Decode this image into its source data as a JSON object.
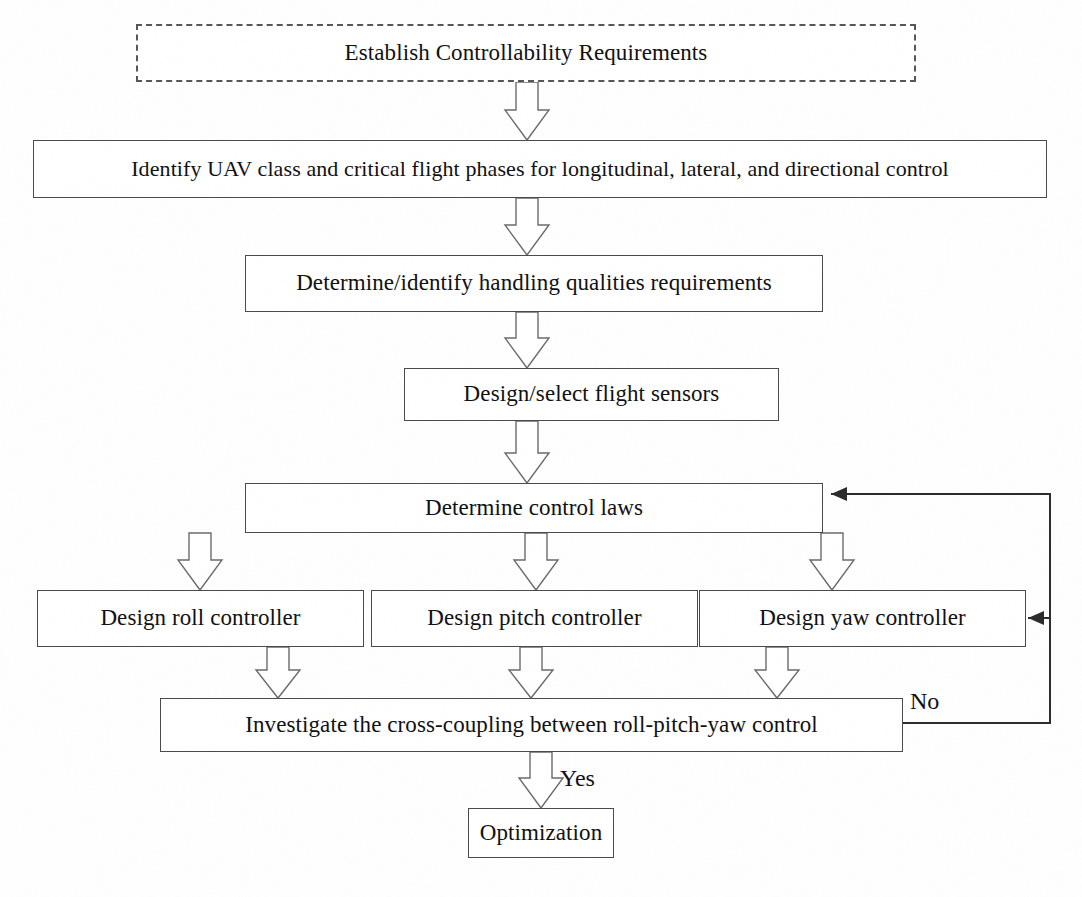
{
  "diagram": {
    "canvas": {
      "width": 1082,
      "height": 897
    },
    "colors": {
      "background": "#fefefe",
      "box_border": "#4a4a4a",
      "dashed_border": "#55555a",
      "arrow_outline": "#6b6b6b",
      "arrow_fill": "#ffffff",
      "line": "#2b2b2b",
      "text": "#101010"
    },
    "nodes": [
      {
        "id": "establish",
        "label": "Establish Controllability Requirements",
        "style": "dashed",
        "x": 136,
        "y": 24,
        "w": 780,
        "h": 58,
        "font_size": 23
      },
      {
        "id": "identify",
        "label": "Identify UAV class and critical flight phases for longitudinal, lateral, and directional control",
        "style": "solid",
        "x": 33,
        "y": 140,
        "w": 1014,
        "h": 58,
        "font_size": 22
      },
      {
        "id": "handling",
        "label": "Determine/identify handling qualities requirements",
        "style": "solid",
        "x": 245,
        "y": 255,
        "w": 578,
        "h": 57,
        "font_size": 23
      },
      {
        "id": "sensors",
        "label": "Design/select flight sensors",
        "style": "solid",
        "x": 404,
        "y": 368,
        "w": 375,
        "h": 53,
        "font_size": 23
      },
      {
        "id": "control-laws",
        "label": "Determine control laws",
        "style": "solid",
        "x": 245,
        "y": 483,
        "w": 578,
        "h": 50,
        "font_size": 23
      },
      {
        "id": "roll",
        "label": "Design roll controller",
        "style": "solid",
        "x": 37,
        "y": 590,
        "w": 327,
        "h": 57,
        "font_size": 23
      },
      {
        "id": "pitch",
        "label": "Design pitch controller",
        "style": "solid",
        "x": 371,
        "y": 590,
        "w": 327,
        "h": 57,
        "font_size": 23
      },
      {
        "id": "yaw",
        "label": "Design yaw controller",
        "style": "solid",
        "x": 699,
        "y": 590,
        "w": 327,
        "h": 57,
        "font_size": 23
      },
      {
        "id": "investigate",
        "label": "Investigate the cross-coupling between roll-pitch-yaw control",
        "style": "solid",
        "x": 160,
        "y": 698,
        "w": 743,
        "h": 54,
        "font_size": 23
      },
      {
        "id": "optimization",
        "label": "Optimization",
        "style": "solid",
        "x": 468,
        "y": 808,
        "w": 146,
        "h": 50,
        "font_size": 23
      }
    ],
    "block_arrows": [
      {
        "id": "arrow-establish-identify",
        "cx": 527,
        "top": 82,
        "bottom": 140,
        "shaft_w": 22,
        "head_w": 44
      },
      {
        "id": "arrow-identify-handling",
        "cx": 527,
        "top": 198,
        "bottom": 255,
        "shaft_w": 22,
        "head_w": 44
      },
      {
        "id": "arrow-handling-sensors",
        "cx": 527,
        "top": 312,
        "bottom": 368,
        "shaft_w": 22,
        "head_w": 44
      },
      {
        "id": "arrow-sensors-controllaws",
        "cx": 527,
        "top": 421,
        "bottom": 483,
        "shaft_w": 22,
        "head_w": 44
      },
      {
        "id": "arrow-controllaws-roll",
        "cx": 200,
        "top": 533,
        "bottom": 590,
        "shaft_w": 22,
        "head_w": 44
      },
      {
        "id": "arrow-controllaws-pitch",
        "cx": 536,
        "top": 533,
        "bottom": 590,
        "shaft_w": 22,
        "head_w": 44
      },
      {
        "id": "arrow-controllaws-yaw",
        "cx": 832,
        "top": 533,
        "bottom": 590,
        "shaft_w": 22,
        "head_w": 44
      },
      {
        "id": "arrow-roll-investigate",
        "cx": 278,
        "top": 647,
        "bottom": 698,
        "shaft_w": 22,
        "head_w": 44
      },
      {
        "id": "arrow-pitch-investigate",
        "cx": 531,
        "top": 647,
        "bottom": 698,
        "shaft_w": 22,
        "head_w": 44
      },
      {
        "id": "arrow-yaw-investigate",
        "cx": 777,
        "top": 647,
        "bottom": 698,
        "shaft_w": 22,
        "head_w": 44
      },
      {
        "id": "arrow-investigate-optimization",
        "cx": 541,
        "top": 752,
        "bottom": 808,
        "shaft_w": 22,
        "head_w": 44
      }
    ],
    "feedback_lines": [
      {
        "id": "feedback-no-trunk",
        "description": "No branch from Investigate right edge up the right margin",
        "points": "903,723 1050,723 1050,494 831,494",
        "arrowhead": {
          "x": 831,
          "y": 494,
          "dir": "left"
        }
      },
      {
        "id": "feedback-yaw-branch",
        "description": "Branch from right trunk into Design yaw controller",
        "points": "1050,618 1028,618",
        "arrowhead": {
          "x": 1028,
          "y": 618,
          "dir": "left"
        }
      }
    ],
    "edge_labels": [
      {
        "id": "label-no",
        "text": "No",
        "x": 910,
        "y": 688,
        "font_size": 24
      },
      {
        "id": "label-yes",
        "text": "Yes",
        "x": 560,
        "y": 765,
        "font_size": 24
      }
    ]
  }
}
